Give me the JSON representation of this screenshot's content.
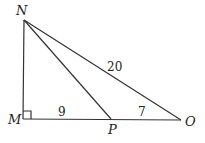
{
  "diagram": {
    "type": "right-triangle",
    "points": {
      "N": {
        "label": "N",
        "x": 24,
        "y": 20
      },
      "M": {
        "label": "M",
        "x": 23,
        "y": 119
      },
      "P": {
        "label": "P",
        "x": 111,
        "y": 119
      },
      "O": {
        "label": "O",
        "x": 181,
        "y": 120
      }
    },
    "segments": [
      "NM",
      "MO",
      "NO",
      "NP"
    ],
    "right_angle_at": "M",
    "lengths": {
      "MP": "9",
      "PO": "7",
      "NO": "20"
    }
  }
}
